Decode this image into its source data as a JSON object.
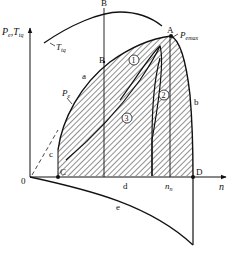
{
  "diagram": {
    "axis_y_label_main": "P",
    "axis_y_label_sub1": "e",
    "axis_y_label_sep": ",",
    "axis_y_label_main2": "T",
    "axis_y_label_sub2": "tq",
    "axis_x_label": "n",
    "origin_label": "0",
    "points": {
      "A": "A",
      "B_top": "B",
      "B_mid": "B",
      "C": "C",
      "D": "D"
    },
    "curve_labels": {
      "a": "a",
      "b": "b",
      "c": "c",
      "d": "d",
      "e": "e"
    },
    "torque_curve_label_main": "T",
    "torque_curve_label_sub": "tq",
    "power_curve_label_main": "P",
    "power_curve_label_sub": "e",
    "pemax_label_main": "P",
    "pemax_label_sub": "emax",
    "nn_label_main": "n",
    "nn_label_sub": "n",
    "region_labels": [
      "1",
      "2",
      "3"
    ],
    "colors": {
      "line": "#111111",
      "hatch": "#222222",
      "background": "#ffffff"
    }
  }
}
